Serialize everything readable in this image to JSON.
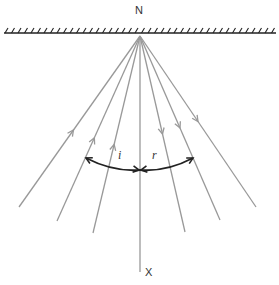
{
  "diagram": {
    "type": "reflection-of-light",
    "labels": {
      "top": "N",
      "bottom": "X",
      "incidence_angle": "i",
      "reflection_angle": "r"
    },
    "mirror": {
      "x1": 4,
      "x2": 276,
      "y": 33,
      "hatch_spacing": 6.5,
      "hatch_height": 5
    },
    "point_of_incidence": {
      "x": 140,
      "y": 36
    },
    "normal": {
      "x": 140,
      "y1": 36,
      "y2": 272
    },
    "incident_rays": [
      {
        "start": [
          19,
          207
        ],
        "arrow_at": 0.45
      },
      {
        "start": [
          57,
          221
        ],
        "arrow_at": 0.45
      },
      {
        "start": [
          93,
          233
        ],
        "arrow_at": 0.45
      }
    ],
    "reflected_rays": [
      {
        "end": [
          185,
          232
        ],
        "arrow_at": 0.5
      },
      {
        "end": [
          220,
          220
        ],
        "arrow_at": 0.5
      },
      {
        "end": [
          256,
          207
        ],
        "arrow_at": 0.5
      }
    ],
    "angle_arc": {
      "left": [
        86,
        158
      ],
      "center": [
        140,
        170
      ],
      "right": [
        193,
        158
      ]
    },
    "colors": {
      "rays": "#999999",
      "mirror": "#222222",
      "arc": "#222222",
      "text": "#333333"
    }
  }
}
